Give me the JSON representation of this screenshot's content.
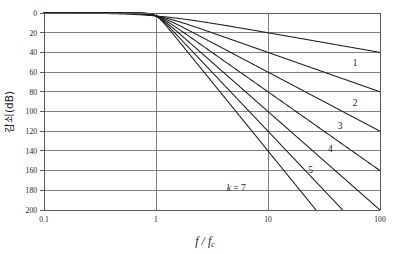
{
  "chart_data": {
    "type": "line",
    "title": "",
    "xlabel": "f/fc",
    "xlabel_numerator": "f",
    "xlabel_denominator": "f",
    "xlabel_subscript": "c",
    "ylabel": "감쇠(dB)",
    "xscale": "log",
    "xlim": [
      0.1,
      100
    ],
    "ylim": [
      0,
      200
    ],
    "y_inverted": true,
    "grid": true,
    "legend_position": "inline-right",
    "xticks": [
      "0.1",
      "1",
      "10",
      "100"
    ],
    "xtick_values": [
      0.1,
      1,
      10,
      100
    ],
    "yticks": [
      "0",
      "20",
      "40",
      "60",
      "80",
      "100",
      "120",
      "140",
      "160",
      "180",
      "200"
    ],
    "ytick_values": [
      0,
      20,
      40,
      60,
      80,
      100,
      120,
      140,
      160,
      180,
      200
    ],
    "series": [
      {
        "name": "1",
        "order": 1,
        "label": "1",
        "label_x": 60,
        "label_y": 54,
        "asymptote_slope_db_per_decade": 20,
        "attenuation_at_x": [
          {
            "x": 0.1,
            "y": 0.04
          },
          {
            "x": 1,
            "y": 3.01
          },
          {
            "x": 10,
            "y": 20.04
          },
          {
            "x": 100,
            "y": 40.0
          }
        ]
      },
      {
        "name": "2",
        "order": 2,
        "label": "2",
        "label_x": 60,
        "label_y": 94,
        "asymptote_slope_db_per_decade": 40,
        "attenuation_at_x": [
          {
            "x": 0.1,
            "y": 0.0
          },
          {
            "x": 1,
            "y": 3.01
          },
          {
            "x": 10,
            "y": 40.0
          },
          {
            "x": 100,
            "y": 80.0
          }
        ]
      },
      {
        "name": "3",
        "order": 3,
        "label": "3",
        "label_x": 44,
        "label_y": 118,
        "asymptote_slope_db_per_decade": 60,
        "attenuation_at_x": [
          {
            "x": 0.1,
            "y": 0.0
          },
          {
            "x": 1,
            "y": 3.01
          },
          {
            "x": 10,
            "y": 60.0
          },
          {
            "x": 100,
            "y": 120.0
          }
        ]
      },
      {
        "name": "4",
        "order": 4,
        "label": "4",
        "label_x": 36,
        "label_y": 141,
        "asymptote_slope_db_per_decade": 80,
        "attenuation_at_x": [
          {
            "x": 0.1,
            "y": 0.0
          },
          {
            "x": 1,
            "y": 3.01
          },
          {
            "x": 10,
            "y": 80.0
          },
          {
            "x": 100,
            "y": 160.0
          }
        ]
      },
      {
        "name": "5",
        "order": 5,
        "label": "5",
        "label_x": 24,
        "label_y": 162,
        "asymptote_slope_db_per_decade": 100,
        "attenuation_at_x": [
          {
            "x": 0.1,
            "y": 0.0
          },
          {
            "x": 1,
            "y": 3.01
          },
          {
            "x": 10,
            "y": 100.0
          },
          {
            "x": 100,
            "y": 200.0
          }
        ]
      },
      {
        "name": "6",
        "order": 6,
        "label": "",
        "label_x": 0,
        "label_y": 0,
        "asymptote_slope_db_per_decade": 120,
        "attenuation_at_x": [
          {
            "x": 0.1,
            "y": 0.0
          },
          {
            "x": 1,
            "y": 3.01
          },
          {
            "x": 10,
            "y": 120.0
          },
          {
            "x": 26,
            "y": 200.0
          }
        ]
      },
      {
        "name": "k = 7",
        "order": 7,
        "label": "k = 7",
        "label_x": 5.2,
        "label_y": 181,
        "asymptote_slope_db_per_decade": 140,
        "attenuation_at_x": [
          {
            "x": 0.1,
            "y": 0.0
          },
          {
            "x": 1,
            "y": 3.01
          },
          {
            "x": 10,
            "y": 140.0
          },
          {
            "x": 27,
            "y": 200.0
          }
        ]
      }
    ]
  },
  "colors": {
    "background": "#ffffff",
    "curve": "#1b1b1b",
    "grid": "#6f7478",
    "axis": "#555a5e",
    "text": "#1a1a1a"
  }
}
